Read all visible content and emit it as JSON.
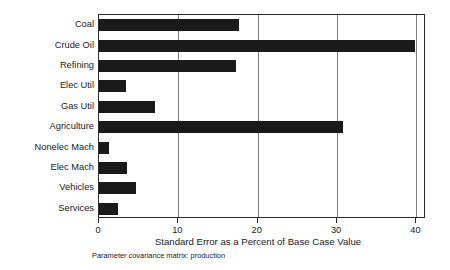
{
  "chart_data": {
    "type": "bar",
    "orientation": "horizontal",
    "title": "",
    "xlabel": "Standard Error as a Percent of Base Case Value",
    "ylabel": "",
    "caption": "Parameter covariance matrix: production",
    "categories": [
      "Coal",
      "Crude Oil",
      "Refining",
      "Elec Util",
      "Gas Util",
      "Agriculture",
      "Nonelec Mach",
      "Elec Mach",
      "Vehicles",
      "Services"
    ],
    "values": [
      17.7,
      39.8,
      17.3,
      3.4,
      7.1,
      30.8,
      1.3,
      3.5,
      4.7,
      2.4
    ],
    "xlim": [
      0,
      41.2
    ],
    "xticks": [
      0,
      10,
      20,
      30,
      40
    ],
    "xtick_labels": [
      "0",
      "10",
      "20",
      "30",
      "40"
    ],
    "grid": true,
    "grid_axis": "x",
    "legend": false,
    "bar_color": "#1a1a1a",
    "grid_color": "#7d7d7d",
    "axis_color": "#2b2b2b",
    "background_color": "#ffffff"
  }
}
